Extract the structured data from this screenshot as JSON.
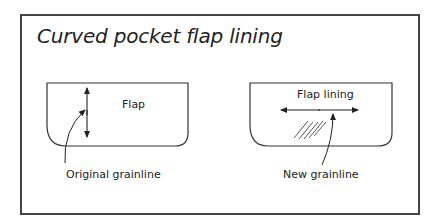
{
  "title": "Curved pocket flap lining",
  "left_panel": {
    "piece_label": "Flap",
    "callout_label": "Original grainline",
    "grainline_orientation": "vertical"
  },
  "right_panel": {
    "piece_label": "Flap lining",
    "callout_label": "New grainline",
    "grainline_orientation": "horizontal",
    "hatch": "bias-hatching"
  },
  "colors": {
    "line": "#333333",
    "frame": "#444444",
    "background": "#ffffff"
  }
}
